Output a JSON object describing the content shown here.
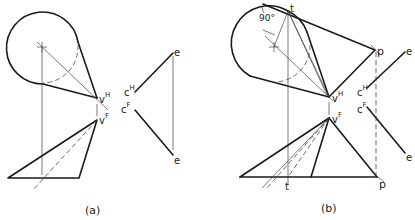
{
  "figure": {
    "panels": [
      {
        "id": "a",
        "caption": "(a)",
        "labels": {
          "vH": {
            "base": "v",
            "sup": "H"
          },
          "vF": {
            "base": "v",
            "sup": "F"
          },
          "cH": {
            "base": "c",
            "sup": "H"
          },
          "cF": {
            "base": "c",
            "sup": "F"
          },
          "e_top": "e",
          "e_bottom": "e"
        }
      },
      {
        "id": "b",
        "caption": "(b)",
        "labels": {
          "angle": "90°",
          "t_top": "t",
          "t_bottom": "t",
          "p_top": "p",
          "p_bottom": "p",
          "vH": {
            "base": "v",
            "sup": "H"
          },
          "vF": {
            "base": "v",
            "sup": "F"
          },
          "cH": {
            "base": "c",
            "sup": "H"
          },
          "cF": {
            "base": "c",
            "sup": "F"
          },
          "e_top": "e",
          "e_bottom": "e"
        }
      }
    ],
    "colors": {
      "line": "#1a1a1a",
      "construction": "#444444",
      "background": "#ffffff"
    }
  }
}
